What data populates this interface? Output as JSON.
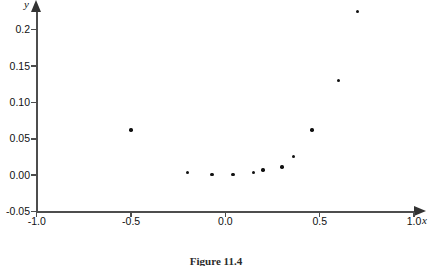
{
  "figure": {
    "caption": "Figure 11.4",
    "background_color": "#ffffff",
    "axis_color": "#4d4d4d",
    "point_color": "#111111"
  },
  "chart_data": {
    "type": "scatter",
    "title": "",
    "xlabel": "x",
    "ylabel": "y",
    "xlim": [
      -1.0,
      1.0
    ],
    "ylim": [
      -0.05,
      0.23
    ],
    "grid": false,
    "legend": null,
    "xticks": [
      -1.0,
      -0.5,
      0.0,
      0.5,
      1.0
    ],
    "xtick_labels": [
      "-1.0",
      "-0.5",
      "0.0",
      "0.5",
      "1.0"
    ],
    "yticks": [
      -0.05,
      0.0,
      0.05,
      0.1,
      0.15,
      0.2
    ],
    "ytick_labels": [
      "-0.05",
      "0.00",
      "0.05",
      "0.10",
      "0.15",
      "0.2"
    ],
    "marker": "dot",
    "points": [
      {
        "x": -0.5,
        "y": 0.062
      },
      {
        "x": -0.2,
        "y": 0.004
      },
      {
        "x": -0.07,
        "y": 0.001
      },
      {
        "x": 0.04,
        "y": 0.001
      },
      {
        "x": 0.15,
        "y": 0.004
      },
      {
        "x": 0.2,
        "y": 0.007
      },
      {
        "x": 0.3,
        "y": 0.011
      },
      {
        "x": 0.36,
        "y": 0.026
      },
      {
        "x": 0.46,
        "y": 0.062
      },
      {
        "x": 0.6,
        "y": 0.13
      },
      {
        "x": 0.7,
        "y": 0.225
      }
    ]
  }
}
